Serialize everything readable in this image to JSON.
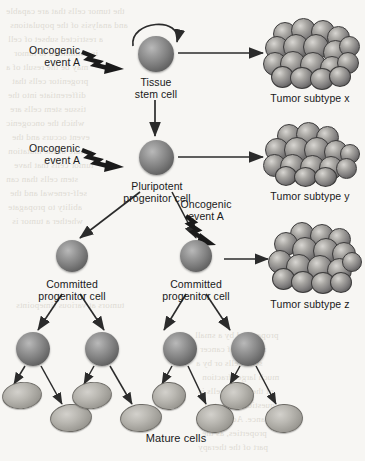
{
  "figure": {
    "background_color": "#f7f6f3",
    "cell_color": "#7d7d7d",
    "mature_cell_color": "#bab8b2",
    "line_color": "#2b2b2b"
  },
  "labels": {
    "oncogenic_event_1": "Oncogenic\nevent A",
    "oncogenic_event_2": "Oncogenic\nevent A",
    "oncogenic_event_3": "Oncogenic\nevent A",
    "tissue_stem_cell": "Tissue\nstem cell",
    "pluripotent_progenitor": "Pluripotent\nprogenitor cell",
    "committed_progenitor_left": "Committed\nprogenitor cell",
    "committed_progenitor_right": "Committed\nprogenitor cell",
    "mature_cells": "Mature cells",
    "tumor_subtype_x": "Tumor subtype x",
    "tumor_subtype_y": "Tumor subtype y",
    "tumor_subtype_z": "Tumor subtype z"
  },
  "icons": {
    "self_renewal": "self-renewal-loop-icon",
    "lightning": "lightning-bolt-arrow-icon",
    "arrow": "arrow-icon"
  },
  "bleed_text": [
    "the tumor cells that are capable",
    "and analysis of the populations",
    "a restricted subset of cell",
    "is committed to tumor",
    "may be the result of a",
    "progenitor cells that",
    "differentiate into the",
    "tissue stem cells are",
    "which the oncogenic",
    "event occurs and the",
    "nature of the mutation",
    "tumor cells that have",
    "stem cells than can",
    "self-renewal and the",
    "ability to propagate",
    "whether a tumor is",
    "propagated by a small",
    "number of cancer",
    "stem cells or by a",
    "much larger fraction",
    "of the tumor cells is",
    "a question of central",
    "importance. Accordingly",
    "properties, as the",
    "part of the therapy",
    "tumors at various timepoints"
  ]
}
